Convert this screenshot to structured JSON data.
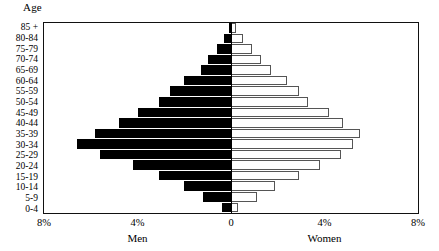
{
  "axis_title": "Age",
  "x_tick_labels": [
    "8%",
    "4%",
    "0",
    "4%",
    "8%"
  ],
  "series_labels": {
    "left": "Men",
    "right": "Women"
  },
  "colors": {
    "men": "#000000",
    "women": "#ffffff",
    "border": "#555555",
    "frame": "#111111"
  },
  "chart_data": {
    "type": "bar",
    "subtype": "population-pyramid",
    "title": "",
    "xlabel": "",
    "ylabel": "Age",
    "categories": [
      "85 +",
      "80-84",
      "75-79",
      "70-74",
      "65-69",
      "60-64",
      "55-59",
      "50-54",
      "45-49",
      "40-44",
      "35-39",
      "30-34",
      "25-29",
      "20-24",
      "15-19",
      "10-14",
      "5-9",
      "0-4"
    ],
    "series": [
      {
        "name": "Men",
        "side": "left",
        "values": [
          0.1,
          0.3,
          0.6,
          1.0,
          1.3,
          2.0,
          2.6,
          3.1,
          4.0,
          4.8,
          5.8,
          6.6,
          5.6,
          4.2,
          3.1,
          2.0,
          1.2,
          0.4
        ]
      },
      {
        "name": "Women",
        "side": "right",
        "values": [
          0.2,
          0.5,
          0.9,
          1.3,
          1.7,
          2.4,
          2.9,
          3.3,
          4.2,
          4.8,
          5.5,
          5.2,
          4.7,
          3.8,
          2.9,
          1.9,
          1.1,
          0.3
        ]
      }
    ],
    "xlim": [
      -8,
      8
    ],
    "x_ticks": [
      -8,
      -4,
      0,
      4,
      8
    ],
    "x_unit": "%",
    "grid": false,
    "legend": "none"
  }
}
